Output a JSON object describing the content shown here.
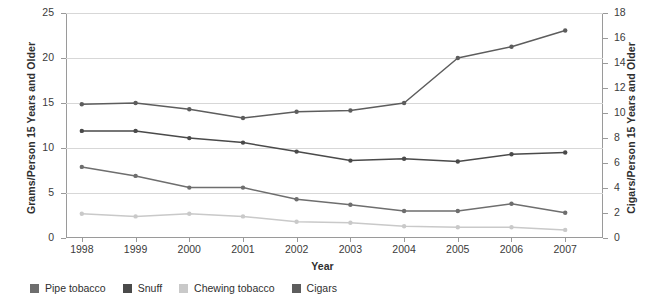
{
  "chart_data": {
    "type": "line",
    "title": "",
    "xlabel": "Year",
    "ylabel": "Grams/Person 15 Years and Older",
    "y2label": "Cigars/Person 15 Years and Older",
    "categories": [
      "1998",
      "1999",
      "2000",
      "2001",
      "2002",
      "2003",
      "2004",
      "2005",
      "2006",
      "2007"
    ],
    "ylim": [
      0,
      25
    ],
    "yticks": [
      "0",
      "5",
      "10",
      "15",
      "20",
      "25"
    ],
    "y2lim": [
      0,
      18
    ],
    "y2ticks": [
      "0",
      "2",
      "4",
      "6",
      "8",
      "10",
      "12",
      "14",
      "16",
      "18"
    ],
    "grid": true,
    "legend_position": "bottom-left",
    "series": [
      {
        "name": "Pipe tobacco",
        "axis": "left",
        "color": "#6e6e6e",
        "values": [
          7.9,
          6.9,
          5.6,
          5.6,
          4.3,
          3.7,
          3.0,
          3.0,
          3.8,
          2.8
        ]
      },
      {
        "name": "Snuff",
        "axis": "left",
        "color": "#4a4a4a",
        "values": [
          11.9,
          11.9,
          11.1,
          10.6,
          9.6,
          8.6,
          8.8,
          8.5,
          9.3,
          9.5
        ]
      },
      {
        "name": "Chewing tobacco",
        "axis": "left",
        "color": "#c9c9c9",
        "values": [
          2.7,
          2.4,
          2.7,
          2.4,
          1.8,
          1.7,
          1.3,
          1.2,
          1.2,
          0.9
        ]
      },
      {
        "name": "Cigars",
        "axis": "right",
        "color": "#5d5d5d",
        "values": [
          10.7,
          10.8,
          10.3,
          9.6,
          10.1,
          10.2,
          10.8,
          14.4,
          15.3,
          16.6
        ]
      }
    ]
  },
  "legend": {
    "items": [
      {
        "label": "Pipe tobacco",
        "color": "#6e6e6e"
      },
      {
        "label": "Snuff",
        "color": "#4a4a4a"
      },
      {
        "label": "Chewing tobacco",
        "color": "#c9c9c9"
      },
      {
        "label": "Cigars",
        "color": "#5d5d5d"
      }
    ]
  }
}
